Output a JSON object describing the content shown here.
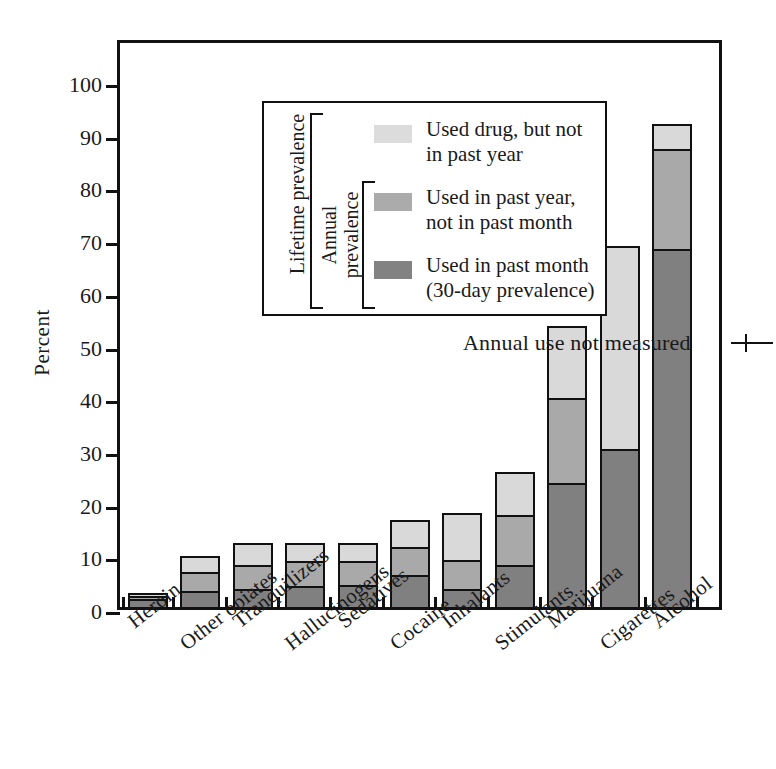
{
  "chart_data": {
    "type": "bar",
    "subtype": "stacked-bar",
    "title": "",
    "xlabel": "",
    "ylabel": "Percent",
    "ylim": [
      0,
      100
    ],
    "yticks": [
      0,
      10,
      20,
      30,
      40,
      50,
      60,
      70,
      80,
      90,
      100
    ],
    "grid": false,
    "legend_position": "upper-left-inside",
    "categories": [
      "Heroin",
      "Other opiates",
      "Tranquilizers",
      "Hallucinogens",
      "Sedatives",
      "Cocaine",
      "Inhalants",
      "Stimulants",
      "Marijuana",
      "Cigarettes",
      "Alcohol"
    ],
    "series": [
      {
        "name": "Used in past month (30-day prevalence)",
        "key": "dark",
        "color": "#808080",
        "values": [
          1.5,
          3.1,
          3.5,
          3.9,
          4.2,
          6.0,
          3.4,
          7.9,
          23.6,
          30.0,
          67.9
        ]
      },
      {
        "name": "Used in past year, not in past month",
        "key": "mid",
        "color": "#a9a9a9",
        "values": [
          0.6,
          3.5,
          4.4,
          4.9,
          4.6,
          5.3,
          5.5,
          9.6,
          16.1,
          0.0,
          19.1
        ]
      },
      {
        "name": "Used drug, but not in past year",
        "key": "light",
        "color": "#d9d9d9",
        "values": [
          0.6,
          3.1,
          4.2,
          3.3,
          3.3,
          5.3,
          8.9,
          8.2,
          13.7,
          38.5,
          4.7
        ]
      }
    ],
    "totals": [
      2.7,
      9.7,
      12.1,
      12.1,
      12.1,
      16.6,
      17.8,
      25.7,
      53.4,
      68.5,
      91.7
    ],
    "segment_tops": {
      "Heroin": {
        "dark": 1.5,
        "mid": 2.1,
        "light": 2.7
      },
      "Other opiates": {
        "dark": 3.1,
        "mid": 6.6,
        "light": 9.7
      },
      "Tranquilizers": {
        "dark": 3.5,
        "mid": 7.9,
        "light": 12.1
      },
      "Hallucinogens": {
        "dark": 3.9,
        "mid": 8.8,
        "light": 12.1
      },
      "Sedatives": {
        "dark": 4.2,
        "mid": 8.8,
        "light": 12.1
      },
      "Cocaine": {
        "dark": 6.0,
        "mid": 11.3,
        "light": 16.6
      },
      "Inhalants": {
        "dark": 3.4,
        "mid": 8.9,
        "light": 17.8
      },
      "Stimulants": {
        "dark": 7.9,
        "mid": 17.5,
        "light": 25.7
      },
      "Marijuana": {
        "dark": 23.6,
        "mid": 39.7,
        "light": 53.4
      },
      "Cigarettes": {
        "dark": 30.0,
        "mid": 30.0,
        "light": 68.5
      },
      "Alcohol": {
        "dark": 67.9,
        "mid": 87.0,
        "light": 91.7
      }
    },
    "annotations": [
      {
        "text": "Annual use not measured",
        "points_to": "Cigarettes"
      }
    ]
  },
  "axis": {
    "y_label": "Percent",
    "y_ticks": [
      "100",
      "90",
      "80",
      "70",
      "60",
      "50",
      "40",
      "30",
      "20",
      "10",
      "0"
    ]
  },
  "legend": {
    "entries": [
      {
        "label": "Used drug, but not\nin past year",
        "swatch": "light"
      },
      {
        "label": "Used in past year,\nnot in past month",
        "swatch": "mid"
      },
      {
        "label": "Used in past month\n(30-day prevalence)",
        "swatch": "dark"
      }
    ],
    "brackets": [
      {
        "label": "Lifetime prevalence",
        "covers": "all three"
      },
      {
        "label": "Annual\nprevalence",
        "covers": "lower two"
      }
    ]
  },
  "annotation": {
    "text": "Annual use not measured"
  },
  "colors": {
    "light": "#d9d9d9",
    "mid": "#a9a9a9",
    "dark": "#808080",
    "outline": "#111111",
    "background": "#ffffff"
  }
}
